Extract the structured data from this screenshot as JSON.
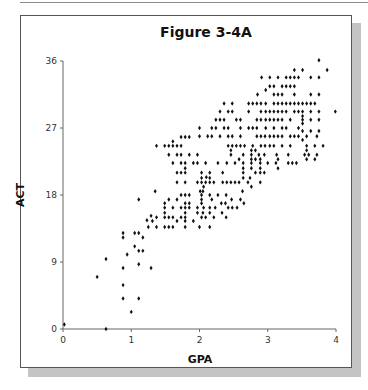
{
  "figure": {
    "title": "Figure 3-4A"
  },
  "chart_data": {
    "type": "scatter",
    "title": "Figure 3-4A",
    "xlabel": "GPA",
    "ylabel": "ACT",
    "xlim": [
      0,
      4
    ],
    "ylim": [
      0,
      36
    ],
    "xticks": [
      0,
      1,
      2,
      3,
      4
    ],
    "yticks": [
      0,
      9,
      18,
      27,
      36
    ],
    "grid": false,
    "legend": null,
    "marker": "diamond",
    "marker_color": "#111111",
    "points": [
      [
        0.02,
        0.6
      ],
      [
        0.63,
        0
      ],
      [
        0.5,
        7
      ],
      [
        0.63,
        9.4
      ],
      [
        0.88,
        12.9
      ],
      [
        0.88,
        12.3
      ],
      [
        0.94,
        10
      ],
      [
        0.88,
        8.2
      ],
      [
        0.88,
        5.9
      ],
      [
        0.88,
        4.1
      ],
      [
        1.0,
        2.3
      ],
      [
        1.11,
        17.4
      ],
      [
        1.05,
        12.9
      ],
      [
        1.11,
        12.9
      ],
      [
        1.17,
        12.3
      ],
      [
        1.05,
        11.1
      ],
      [
        1.11,
        10.5
      ],
      [
        1.17,
        10.5
      ],
      [
        1.11,
        8.7
      ],
      [
        1.11,
        4.1
      ],
      [
        1.29,
        8.2
      ],
      [
        1.23,
        14.6
      ],
      [
        1.29,
        15.2
      ],
      [
        1.25,
        13.7
      ],
      [
        1.37,
        13.7
      ],
      [
        1.49,
        13.7
      ],
      [
        1.55,
        13.7
      ],
      [
        1.61,
        13.7
      ],
      [
        1.79,
        13.7
      ],
      [
        2.0,
        13.7
      ],
      [
        2.15,
        13.7
      ],
      [
        1.31,
        14.5
      ],
      [
        1.67,
        14.5
      ],
      [
        1.79,
        14.5
      ],
      [
        1.91,
        14.5
      ],
      [
        1.37,
        15
      ],
      [
        1.49,
        15
      ],
      [
        1.55,
        15
      ],
      [
        1.61,
        15
      ],
      [
        1.73,
        15
      ],
      [
        1.79,
        15
      ],
      [
        2.03,
        15
      ],
      [
        2.09,
        15
      ],
      [
        2.21,
        15
      ],
      [
        2.39,
        15
      ],
      [
        1.49,
        15.6
      ],
      [
        1.79,
        15.6
      ],
      [
        1.97,
        15.6
      ],
      [
        2.05,
        15.6
      ],
      [
        2.15,
        15.6
      ],
      [
        2.33,
        15.6
      ],
      [
        1.85,
        16.3
      ],
      [
        1.49,
        16.3
      ],
      [
        1.61,
        16.3
      ],
      [
        1.73,
        16.3
      ],
      [
        1.79,
        16.3
      ],
      [
        1.97,
        16.3
      ],
      [
        2.06,
        16.3
      ],
      [
        2.15,
        16.3
      ],
      [
        2.23,
        16.3
      ],
      [
        2.42,
        16.3
      ],
      [
        2.48,
        16.3
      ],
      [
        2.55,
        16.3
      ],
      [
        1.49,
        16.9
      ],
      [
        1.79,
        16.9
      ],
      [
        1.85,
        16.9
      ],
      [
        2.03,
        16.9
      ],
      [
        2.32,
        16.9
      ],
      [
        2.38,
        16.9
      ],
      [
        2.65,
        16.9
      ],
      [
        2.03,
        17.4
      ],
      [
        2.18,
        17.4
      ],
      [
        2.47,
        17.4
      ],
      [
        2.6,
        17.4
      ],
      [
        1.55,
        17.4
      ],
      [
        1.67,
        17.4
      ],
      [
        1.73,
        18
      ],
      [
        1.79,
        18
      ],
      [
        1.85,
        18
      ],
      [
        2.03,
        18
      ],
      [
        2.15,
        18
      ],
      [
        2.27,
        18
      ],
      [
        2.39,
        18
      ],
      [
        2.01,
        18.5
      ],
      [
        1.35,
        18.5
      ],
      [
        2.05,
        18.5
      ],
      [
        2.63,
        18.5
      ],
      [
        2.06,
        19.1
      ],
      [
        2.76,
        19.1
      ],
      [
        1.67,
        19.7
      ],
      [
        1.79,
        19.7
      ],
      [
        1.97,
        19.7
      ],
      [
        2.03,
        19.7
      ],
      [
        2.09,
        19.7
      ],
      [
        2.15,
        19.7
      ],
      [
        2.21,
        19.7
      ],
      [
        2.34,
        19.7
      ],
      [
        2.4,
        19.7
      ],
      [
        2.46,
        19.7
      ],
      [
        2.52,
        19.7
      ],
      [
        2.58,
        19.7
      ],
      [
        2.71,
        19.7
      ],
      [
        2.89,
        19.7
      ],
      [
        2.03,
        20.3
      ],
      [
        2.15,
        20.3
      ],
      [
        2.1,
        20.4
      ],
      [
        2.64,
        20.3
      ],
      [
        2.74,
        20.3
      ],
      [
        1.67,
        21
      ],
      [
        1.73,
        21
      ],
      [
        1.79,
        21
      ],
      [
        2.03,
        21
      ],
      [
        2.15,
        21
      ],
      [
        2.34,
        21
      ],
      [
        2.64,
        21
      ],
      [
        2.82,
        21
      ],
      [
        2.89,
        21
      ],
      [
        2.95,
        21
      ],
      [
        1.79,
        21.6
      ],
      [
        2.64,
        21.6
      ],
      [
        2.76,
        21.6
      ],
      [
        2.89,
        21.6
      ],
      [
        3.15,
        21.6
      ],
      [
        1.61,
        22.3
      ],
      [
        1.73,
        22.3
      ],
      [
        1.79,
        22.3
      ],
      [
        1.91,
        22.3
      ],
      [
        1.97,
        22.3
      ],
      [
        2.09,
        22.3
      ],
      [
        2.27,
        22.3
      ],
      [
        2.4,
        22.3
      ],
      [
        2.52,
        22.3
      ],
      [
        2.64,
        22.3
      ],
      [
        2.76,
        22.3
      ],
      [
        2.89,
        22.3
      ],
      [
        3.0,
        22.3
      ],
      [
        3.12,
        22.3
      ],
      [
        3.3,
        22.3
      ],
      [
        3.36,
        22.3
      ],
      [
        3.42,
        22.3
      ],
      [
        2.58,
        22.8
      ],
      [
        2.76,
        22.8
      ],
      [
        2.82,
        22.8
      ],
      [
        2.89,
        22.8
      ],
      [
        3.15,
        22.8
      ],
      [
        3.57,
        22.8
      ],
      [
        3.69,
        22.8
      ],
      [
        1.55,
        23.4
      ],
      [
        1.67,
        23.4
      ],
      [
        1.73,
        23.4
      ],
      [
        1.85,
        23.4
      ],
      [
        1.97,
        23.4
      ],
      [
        2.46,
        23.4
      ],
      [
        2.64,
        23.4
      ],
      [
        2.76,
        23.4
      ],
      [
        2.87,
        23.4
      ],
      [
        2.95,
        23.4
      ],
      [
        3.13,
        23.4
      ],
      [
        3.3,
        23.4
      ],
      [
        3.54,
        23.4
      ],
      [
        3.6,
        23.4
      ],
      [
        3.72,
        23.4
      ],
      [
        2.46,
        24
      ],
      [
        2.76,
        24
      ],
      [
        2.82,
        24
      ],
      [
        3.57,
        24
      ],
      [
        1.37,
        24.6
      ],
      [
        1.49,
        24.6
      ],
      [
        1.55,
        24.6
      ],
      [
        1.61,
        24.6
      ],
      [
        1.67,
        24.6
      ],
      [
        1.73,
        24.6
      ],
      [
        2.42,
        24.6
      ],
      [
        2.48,
        24.6
      ],
      [
        2.54,
        24.6
      ],
      [
        2.6,
        24.6
      ],
      [
        2.66,
        24.6
      ],
      [
        2.78,
        24.6
      ],
      [
        2.9,
        24.6
      ],
      [
        2.96,
        24.6
      ],
      [
        3.03,
        24.6
      ],
      [
        3.09,
        24.6
      ],
      [
        3.21,
        24.6
      ],
      [
        3.33,
        24.6
      ],
      [
        3.57,
        24.6
      ],
      [
        3.69,
        24.6
      ],
      [
        3.81,
        24.6
      ],
      [
        1.61,
        25.2
      ],
      [
        1.73,
        25.8
      ],
      [
        1.79,
        25.8
      ],
      [
        1.85,
        25.8
      ],
      [
        2.0,
        25.9
      ],
      [
        2.12,
        25.9
      ],
      [
        2.18,
        25.9
      ],
      [
        2.3,
        25.9
      ],
      [
        2.42,
        25.9
      ],
      [
        2.48,
        25.9
      ],
      [
        2.6,
        25.9
      ],
      [
        2.84,
        25.9
      ],
      [
        2.9,
        25.9
      ],
      [
        2.96,
        25.9
      ],
      [
        3.03,
        25.9
      ],
      [
        3.09,
        25.9
      ],
      [
        3.15,
        25.9
      ],
      [
        3.21,
        25.9
      ],
      [
        3.33,
        25.9
      ],
      [
        3.39,
        25.9
      ],
      [
        3.45,
        25.9
      ],
      [
        3.57,
        25.9
      ],
      [
        3.72,
        25.9
      ],
      [
        2.0,
        27
      ],
      [
        2.18,
        27
      ],
      [
        2.24,
        27
      ],
      [
        2.36,
        27
      ],
      [
        2.42,
        27
      ],
      [
        2.6,
        27
      ],
      [
        2.72,
        27
      ],
      [
        2.78,
        27
      ],
      [
        2.84,
        27
      ],
      [
        2.97,
        27
      ],
      [
        3.09,
        27
      ],
      [
        3.21,
        27
      ],
      [
        3.27,
        27
      ],
      [
        3.45,
        27
      ],
      [
        2.24,
        28.1
      ],
      [
        2.3,
        28.1
      ],
      [
        2.36,
        28.1
      ],
      [
        2.54,
        28.1
      ],
      [
        2.6,
        28.1
      ],
      [
        2.84,
        28.1
      ],
      [
        2.9,
        28.1
      ],
      [
        2.97,
        28.1
      ],
      [
        3.03,
        28.1
      ],
      [
        3.09,
        28.1
      ],
      [
        3.15,
        28.1
      ],
      [
        3.21,
        28.1
      ],
      [
        3.33,
        28.1
      ],
      [
        3.51,
        28.1
      ],
      [
        3.63,
        28.1
      ],
      [
        3.75,
        28.1
      ],
      [
        2.3,
        29.2
      ],
      [
        2.42,
        29.2
      ],
      [
        2.48,
        29.2
      ],
      [
        2.72,
        29.2
      ],
      [
        2.9,
        29.2
      ],
      [
        2.97,
        29.2
      ],
      [
        3.03,
        29.2
      ],
      [
        3.09,
        29.2
      ],
      [
        3.15,
        29.2
      ],
      [
        3.21,
        29.2
      ],
      [
        3.27,
        29.2
      ],
      [
        3.39,
        29.2
      ],
      [
        3.45,
        29.2
      ],
      [
        3.51,
        29.2
      ],
      [
        3.63,
        29.2
      ],
      [
        3.75,
        29.2
      ],
      [
        3.99,
        29.2
      ],
      [
        2.36,
        30.3
      ],
      [
        2.48,
        30.3
      ],
      [
        2.72,
        30.3
      ],
      [
        2.78,
        30.3
      ],
      [
        2.84,
        30.3
      ],
      [
        2.9,
        30.3
      ],
      [
        2.97,
        30.3
      ],
      [
        3.09,
        30.3
      ],
      [
        3.15,
        30.3
      ],
      [
        3.21,
        30.3
      ],
      [
        3.27,
        30.3
      ],
      [
        3.33,
        30.3
      ],
      [
        3.39,
        30.3
      ],
      [
        3.45,
        30.3
      ],
      [
        3.51,
        30.3
      ],
      [
        3.57,
        30.3
      ],
      [
        3.63,
        30.3
      ],
      [
        3.69,
        30.3
      ],
      [
        2.85,
        31.5
      ],
      [
        3.09,
        31.5
      ],
      [
        3.15,
        31.5
      ],
      [
        3.21,
        31.5
      ],
      [
        3.39,
        31.5
      ],
      [
        3.63,
        31.5
      ],
      [
        3.75,
        31.5
      ],
      [
        2.97,
        32.1
      ],
      [
        3.03,
        32.6
      ],
      [
        3.09,
        32.6
      ],
      [
        3.21,
        32.6
      ],
      [
        3.27,
        32.6
      ],
      [
        3.33,
        32.6
      ],
      [
        3.39,
        32.6
      ],
      [
        2.91,
        33.8
      ],
      [
        3.03,
        33.8
      ],
      [
        3.15,
        33.8
      ],
      [
        3.27,
        33.8
      ],
      [
        3.33,
        33.8
      ],
      [
        3.39,
        33.8
      ],
      [
        3.45,
        33.8
      ],
      [
        3.63,
        33.8
      ],
      [
        3.75,
        33.8
      ],
      [
        3.39,
        34.8
      ],
      [
        3.51,
        34.8
      ],
      [
        3.87,
        34.8
      ],
      [
        3.75,
        36.1
      ],
      [
        3.51,
        28.6
      ],
      [
        3.51,
        27.6
      ],
      [
        3.51,
        26.6
      ],
      [
        3.63,
        26.6
      ],
      [
        3.75,
        26.6
      ],
      [
        3.51,
        25.4
      ]
    ]
  }
}
